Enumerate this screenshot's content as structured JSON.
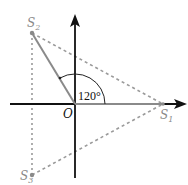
{
  "diagram": {
    "title": "",
    "origin_label": "O",
    "angle_label": "120°",
    "points": [
      {
        "id": "S1",
        "label": "S",
        "sub": "1"
      },
      {
        "id": "S2",
        "label": "S",
        "sub": "2"
      },
      {
        "id": "S3",
        "label": "S",
        "sub": "3"
      }
    ],
    "colors": {
      "axis": "#111111",
      "vector": "#8a8a8a",
      "dashed": "#9a9a9a",
      "label_gray": "#8a8a8a",
      "background": "#ffffff"
    }
  }
}
